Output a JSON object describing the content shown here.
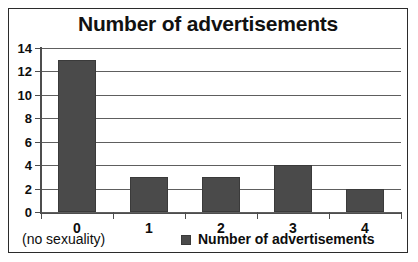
{
  "chart_data": {
    "type": "bar",
    "title": "Number of advertisements",
    "categories": [
      "0",
      "1",
      "2",
      "3",
      "4"
    ],
    "values": [
      13,
      3,
      3,
      4,
      2
    ],
    "series": [
      {
        "name": "Number of advertisements",
        "values": [
          13,
          3,
          3,
          4,
          2
        ]
      }
    ],
    "xlabel": "",
    "ylabel": "",
    "ylim": [
      0,
      14
    ],
    "ytick_labels": [
      "14",
      "12",
      "10",
      "8",
      "6",
      "4",
      "2",
      "0"
    ],
    "ytick_values": [
      14,
      12,
      10,
      8,
      6,
      4,
      2,
      0
    ],
    "grid": true,
    "legend_position": "bottom",
    "annotations": [
      {
        "text": "(no sexuality)",
        "target_category": "0",
        "position": "below-axis-left"
      }
    ],
    "colors": {
      "bar_fill": "#4a4a4a",
      "bar_border": "#3a3a3a",
      "gridline": "#5e5e5e",
      "axis": "#4d4d4d",
      "text": "#0d0d0d",
      "frame_border": "#2b2b2b",
      "background": "#ffffff"
    }
  },
  "legend": {
    "entries": [
      {
        "label": "Number of advertisements",
        "swatch": "legend-swatch-icon"
      }
    ]
  }
}
